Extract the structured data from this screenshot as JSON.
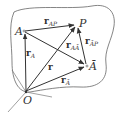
{
  "diagram": {
    "type": "vector-diagram",
    "colors": {
      "stroke": "#333333",
      "outline": "#555555",
      "background": "#ffffff"
    },
    "points": {
      "O": {
        "label": "O",
        "x": 26,
        "y": 92
      },
      "A": {
        "label": "A",
        "x": 24,
        "y": 31
      },
      "P": {
        "label": "P",
        "x": 77,
        "y": 24
      },
      "Abar": {
        "label": "Ā",
        "x": 87,
        "y": 66
      }
    },
    "vectors": [
      {
        "name": "r_A",
        "base": "r",
        "sub": "A",
        "from": "O",
        "to": "A"
      },
      {
        "name": "r",
        "base": "r",
        "sub": "",
        "from": "O",
        "to": "P"
      },
      {
        "name": "r_Abar",
        "base": "r",
        "sub": "Ā",
        "from": "O",
        "to": "Abar"
      },
      {
        "name": "r_AP",
        "base": "r",
        "sub": "AP",
        "from": "A",
        "to": "P"
      },
      {
        "name": "r_AAbar",
        "base": "r",
        "sub": "AĀ",
        "from": "A",
        "to": "Abar"
      },
      {
        "name": "r_AbarP",
        "base": "r",
        "sub": "ĀP",
        "from": "Abar",
        "to": "P"
      }
    ],
    "labels": {
      "O": "O",
      "A": "A",
      "P": "P",
      "Abar": "Ā",
      "r": "r",
      "r_A_base": "r",
      "r_A_sub": "A",
      "r_Abar_base": "r",
      "r_Abar_sub": "Ā",
      "r_AP_base": "r",
      "r_AP_sub": "AP",
      "r_AAbar_base": "r",
      "r_AAbar_sub": "AĀ",
      "r_AbarP_base": "r",
      "r_AbarP_sub": "ĀP"
    }
  }
}
